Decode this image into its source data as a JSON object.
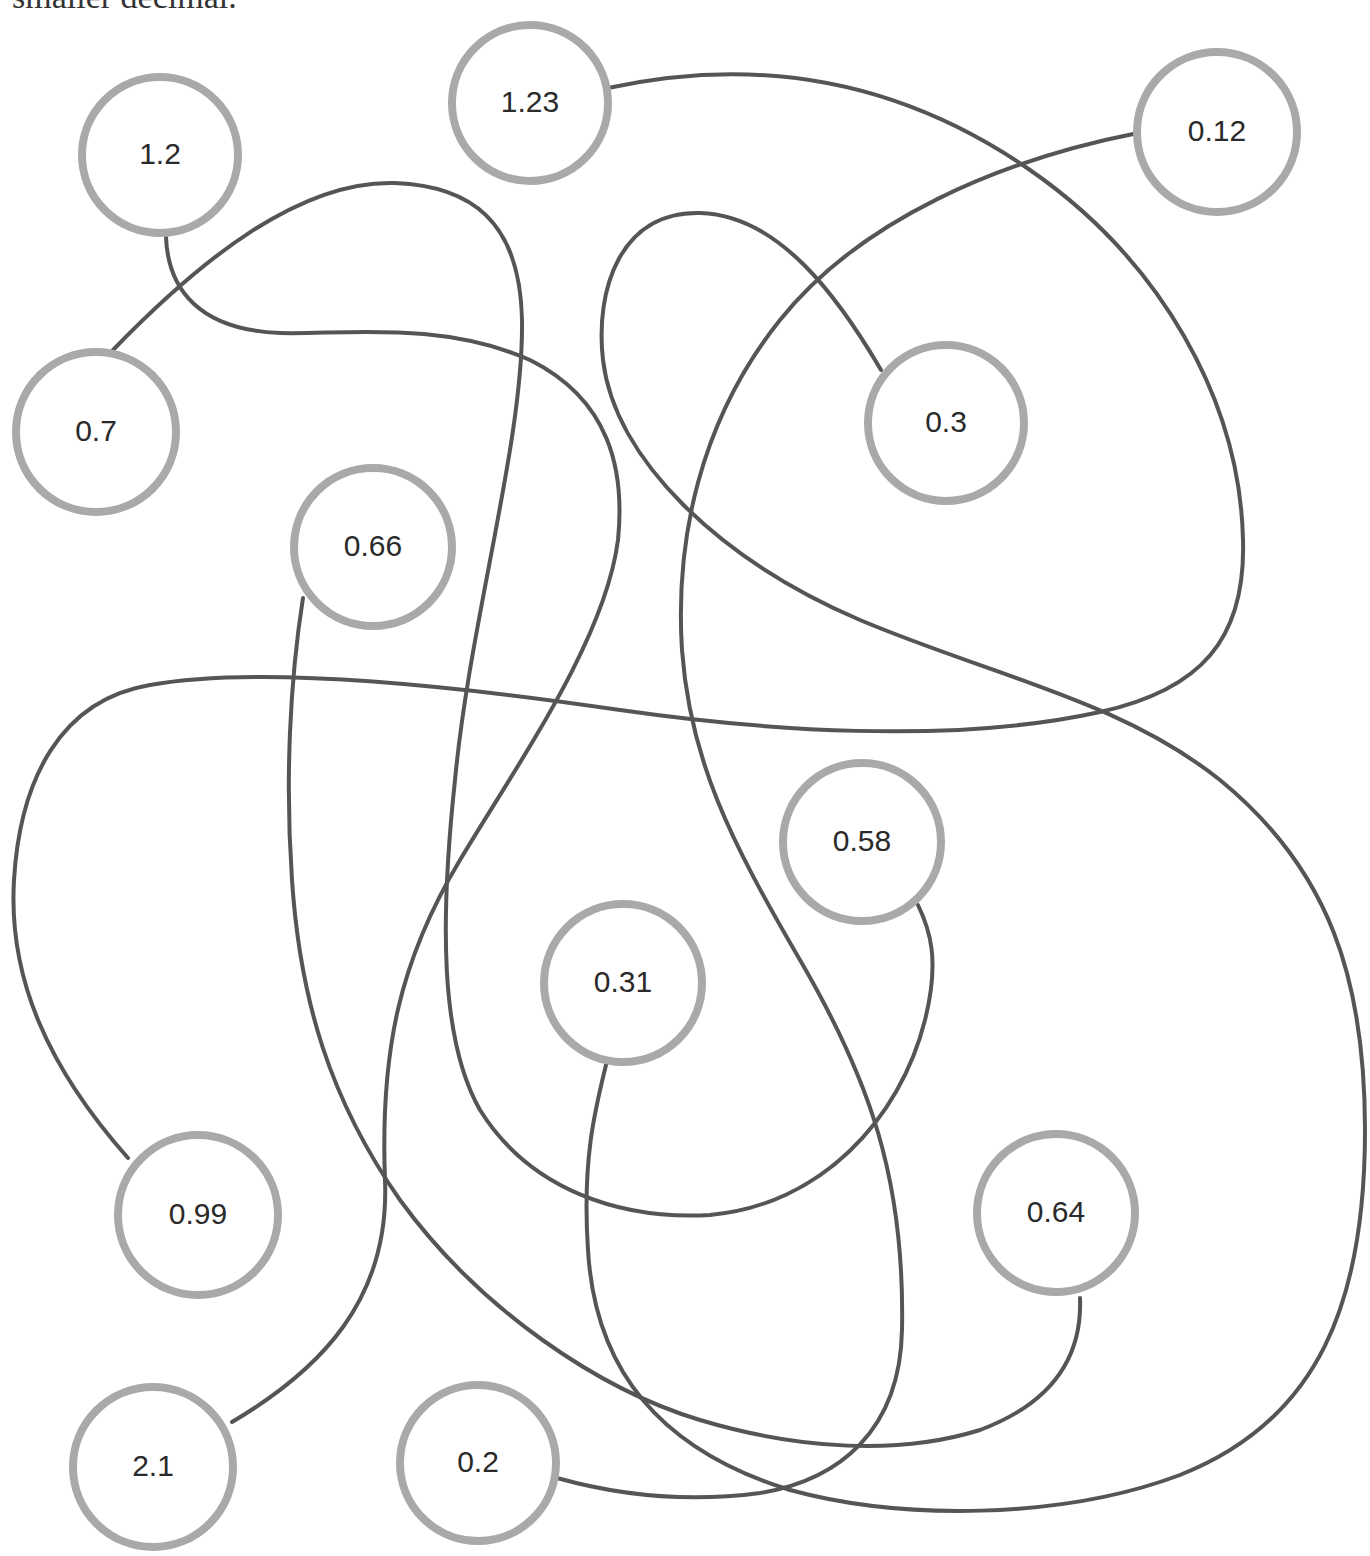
{
  "instruction": {
    "text": "smaller decimal."
  },
  "style": {
    "line_color": "#555555",
    "line_width": 4,
    "ring_color": "#a9a9a9",
    "ring_width": 8,
    "label_color": "#2a2a2a",
    "background": "#ffffff"
  },
  "nodes": [
    {
      "id": "n-1-2",
      "label": "1.2",
      "cx": 160,
      "cy": 155,
      "r": 78
    },
    {
      "id": "n-1-23",
      "label": "1.23",
      "cx": 530,
      "cy": 103,
      "r": 78
    },
    {
      "id": "n-0-12",
      "label": "0.12",
      "cx": 1217,
      "cy": 132,
      "r": 80
    },
    {
      "id": "n-0-7",
      "label": "0.7",
      "cx": 96,
      "cy": 432,
      "r": 80
    },
    {
      "id": "n-0-3",
      "label": "0.3",
      "cx": 946,
      "cy": 423,
      "r": 78
    },
    {
      "id": "n-0-66",
      "label": "0.66",
      "cx": 373,
      "cy": 547,
      "r": 79
    },
    {
      "id": "n-0-58",
      "label": "0.58",
      "cx": 862,
      "cy": 842,
      "r": 79
    },
    {
      "id": "n-0-31",
      "label": "0.31",
      "cx": 623,
      "cy": 983,
      "r": 79
    },
    {
      "id": "n-0-99",
      "label": "0.99",
      "cx": 198,
      "cy": 1215,
      "r": 80
    },
    {
      "id": "n-0-64",
      "label": "0.64",
      "cx": 1056,
      "cy": 1213,
      "r": 79
    },
    {
      "id": "n-2-1",
      "label": "2.1",
      "cx": 153,
      "cy": 1467,
      "r": 80
    },
    {
      "id": "n-0-2",
      "label": "0.2",
      "cx": 478,
      "cy": 1463,
      "r": 78
    }
  ],
  "connections": [
    {
      "from": "0.7",
      "to": "0.58",
      "d": "M113,350 C200,260 300,180 395,183 C470,186 520,220 522,320 C524,440 470,620 455,780 C440,920 440,1040 480,1110 C530,1190 620,1220 710,1215 C820,1205 900,1120 925,1020 C940,960 930,930 918,905"
    },
    {
      "from": "1.2",
      "to": "2.1",
      "d": "M166,237 C168,290 200,330 280,333 C340,335 440,320 530,360 C610,400 625,470 618,540 C605,640 520,760 460,860 C400,960 380,1050 385,1180 C390,1300 320,1370 232,1422"
    },
    {
      "from": "1.23",
      "to": "0.99",
      "d": "M608,88 C760,55 900,80 1030,170 C1160,260 1240,400 1243,540 C1246,640 1200,690 1100,712 C950,745 760,730 620,710 C450,685 260,665 150,685 C60,700 20,780 14,880 C8,980 50,1070 128,1158"
    },
    {
      "from": "0.12",
      "to": "0.2",
      "d": "M1138,133 C1000,160 860,220 780,320 C700,420 675,540 682,650 C690,760 730,840 800,960 C870,1080 905,1180 902,1330 C900,1430 840,1480 760,1493 C670,1505 600,1490 557,1478"
    },
    {
      "from": "0.3",
      "to": "0.31",
      "d": "M881,370 C840,300 780,215 700,213 C620,211 595,290 603,360 C615,460 720,560 860,620 C990,675 1120,700 1220,780 C1330,870 1365,980 1365,1130 C1365,1300 1320,1420 1180,1475 C1060,1520 900,1520 790,1490 C660,1450 595,1370 588,1250 C582,1160 595,1110 606,1065"
    },
    {
      "from": "0.66",
      "to": "0.64",
      "d": "M303,598 C290,680 285,780 292,880 C300,1000 330,1100 400,1200 C480,1310 600,1390 700,1420 C800,1450 900,1455 980,1430 C1060,1400 1082,1350 1080,1298"
    }
  ]
}
